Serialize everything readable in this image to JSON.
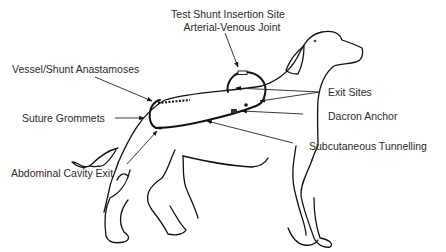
{
  "figure": {
    "labels": {
      "test_shunt_line1": "Test Shunt Insertion Site",
      "test_shunt_line2": "Arterial-Venous Joint",
      "vessel_anastamoses": "Vessel/Shunt Anastamoses",
      "suture_grommets": "Suture Grommets",
      "exit_sites": "Exit Sites",
      "dacron_anchor": "Dacron Anchor",
      "subcutaneous_tunnelling": "Subcutaneous Tunnelling",
      "abdominal_cavity_exit": "Abdominal Cavity Exit"
    },
    "colors": {
      "line": "#111111",
      "text": "#2a2a2a",
      "background": "#ffffff"
    }
  }
}
